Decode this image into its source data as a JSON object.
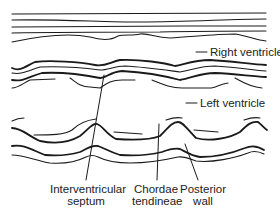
{
  "diagram": {
    "type": "M-mode echocardiogram tracing",
    "colors": {
      "line": "#1a1a1a",
      "thin_line": "#444444",
      "background": "#ffffff",
      "text": "#222222"
    }
  },
  "labels": {
    "right_ventricle": "Right ventricle",
    "left_ventricle": "Left ventricle",
    "interventricular_septum": [
      "Interventricular",
      "septum"
    ],
    "chordae_tendineae": [
      "Chordae",
      "tendineae"
    ],
    "posterior_wall": [
      "Posterior",
      "wall"
    ]
  }
}
